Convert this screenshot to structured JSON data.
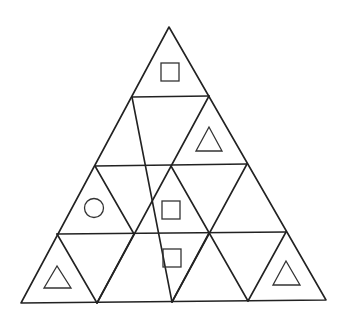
{
  "puzzle": {
    "description": "Triangular grid of 16 small triangles (4 rows) with symbols in some cells",
    "rows": 4,
    "line_color": "#222222",
    "symbol_color": "#333333",
    "outer_triangle": {
      "apex": [
        169,
        27
      ],
      "bottom_left": [
        21,
        303
      ],
      "bottom_right": [
        326,
        300
      ]
    },
    "horizontal_lines": [
      [
        [
          132,
          97
        ],
        [
          209,
          96
        ]
      ],
      [
        [
          95,
          166
        ],
        [
          247,
          164
        ]
      ],
      [
        [
          57,
          234
        ],
        [
          286,
          232
        ]
      ]
    ],
    "diagonal_lines": [
      [
        [
          132,
          97
        ],
        [
          172,
          302
        ]
      ],
      [
        [
          95,
          166
        ],
        [
          134,
          234
        ]
      ],
      [
        [
          57,
          234
        ],
        [
          97,
          303
        ]
      ],
      [
        [
          209,
          96
        ],
        [
          97,
          303
        ]
      ],
      [
        [
          247,
          164
        ],
        [
          172,
          302
        ]
      ],
      [
        [
          286,
          232
        ],
        [
          248,
          301
        ]
      ],
      [
        [
          171,
          166
        ],
        [
          248,
          301
        ]
      ],
      [
        [
          209,
          233
        ],
        [
          172,
          302
        ]
      ],
      [
        [
          134,
          234
        ],
        [
          97,
          303
        ]
      ]
    ],
    "symbols": [
      {
        "type": "square",
        "row": 1,
        "cell": "top",
        "x": 161,
        "y": 63,
        "size": 18
      },
      {
        "type": "triangle",
        "row": 2,
        "cell": "right-up",
        "points": [
          [
            209,
            127
          ],
          [
            196,
            151
          ],
          [
            222,
            151
          ]
        ]
      },
      {
        "type": "circle",
        "row": 3,
        "cell": "left-up",
        "cx": 94,
        "cy": 208,
        "r": 9.5
      },
      {
        "type": "square",
        "row": 3,
        "cell": "center-up",
        "x": 162,
        "y": 201,
        "size": 18
      },
      {
        "type": "square",
        "row": 4,
        "cell": "center-down",
        "x": 163,
        "y": 249,
        "size": 18
      },
      {
        "type": "triangle",
        "row": 4,
        "cell": "left-up",
        "points": [
          [
            57,
            266
          ],
          [
            44,
            288
          ],
          [
            71,
            288
          ]
        ]
      },
      {
        "type": "triangle",
        "row": 4,
        "cell": "right-up",
        "points": [
          [
            286,
            261
          ],
          [
            273,
            285
          ],
          [
            300,
            285
          ]
        ]
      }
    ]
  }
}
